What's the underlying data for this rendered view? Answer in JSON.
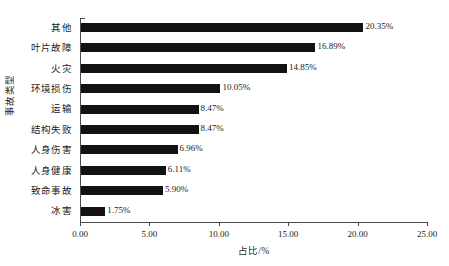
{
  "chart_data": {
    "type": "bar",
    "orientation": "horizontal",
    "title": "",
    "xlabel": "占比/%",
    "ylabel": "事故类型",
    "categories": [
      "其他",
      "叶片故障",
      "火灾",
      "环境损伤",
      "运输",
      "结构失败",
      "人身伤害",
      "人身健康",
      "致命事故",
      "冰害"
    ],
    "values": [
      20.35,
      16.89,
      14.85,
      10.05,
      8.47,
      8.47,
      6.96,
      6.11,
      5.9,
      1.75
    ],
    "data_labels": [
      "20.35%",
      "16.89%",
      "14.85%",
      "10.05%",
      "8.47%",
      "8.47%",
      "6.96%",
      "6.11%",
      "5.90%",
      "1.75%"
    ],
    "xlim": [
      0,
      25
    ],
    "xticks": [
      0,
      5,
      10,
      15,
      20,
      25
    ],
    "xtick_labels": [
      "0.00",
      "5.00",
      "10.00",
      "15.00",
      "20.00",
      "25.00"
    ],
    "grid": false,
    "legend": false,
    "bar_color": "#121212",
    "axis_color": "#4a4a4a",
    "background": "#ffffff"
  }
}
